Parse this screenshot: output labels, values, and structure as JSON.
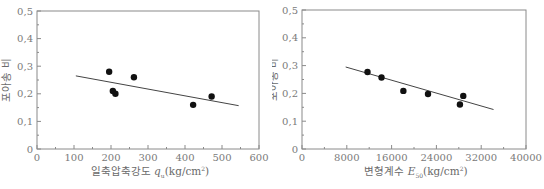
{
  "chart_data": [
    {
      "type": "scatter",
      "title": "",
      "xlabel": "일축압축강도 q_u (kg/cm²)",
      "xlabel_main": "일축압축강도 ",
      "xlabel_var": "q",
      "xlabel_sub": "u",
      "xlabel_unit": "(kg/cm",
      "xlabel_sup": "2",
      "xlabel_close": ")",
      "ylabel": "포아송 비",
      "xlim": [
        0,
        600
      ],
      "ylim": [
        0,
        0.5
      ],
      "xticks": [
        "0",
        "100",
        "200",
        "300",
        "400",
        "500",
        "600"
      ],
      "xtick_values": [
        0,
        100,
        200,
        300,
        400,
        500,
        600
      ],
      "yticks": [
        "0",
        "0.1",
        "0.2",
        "0.3",
        "0.4",
        "0.5"
      ],
      "ytick_values": [
        0,
        0.1,
        0.2,
        0.3,
        0.4,
        0.5
      ],
      "grid": false,
      "legend": null,
      "series": [
        {
          "name": "data",
          "x": [
            195,
            205,
            212,
            262,
            422,
            472
          ],
          "y": [
            0.28,
            0.21,
            0.2,
            0.26,
            0.16,
            0.19
          ]
        }
      ],
      "trendline": {
        "x": [
          105,
          545
        ],
        "y": [
          0.265,
          0.157
        ]
      }
    },
    {
      "type": "scatter",
      "title": "",
      "xlabel": "변형계수 E_50 (kg/cm²)",
      "xlabel_main": "변형계수 ",
      "xlabel_var": "E",
      "xlabel_sub": "50",
      "xlabel_unit": "(kg/cm",
      "xlabel_sup": "2",
      "xlabel_close": ")",
      "ylabel": "포아송 비",
      "xlim": [
        0,
        40000
      ],
      "ylim": [
        0,
        0.5
      ],
      "xticks": [
        "0",
        "8000",
        "16000",
        "24000",
        "32000",
        "40000"
      ],
      "xtick_values": [
        0,
        8000,
        16000,
        24000,
        32000,
        40000
      ],
      "yticks": [
        "0",
        "0.1",
        "0.2",
        "0.3",
        "0.4",
        "0.5"
      ],
      "ytick_values": [
        0,
        0.1,
        0.2,
        0.3,
        0.4,
        0.5
      ],
      "grid": false,
      "legend": null,
      "series": [
        {
          "name": "data",
          "x": [
            11700,
            14200,
            18100,
            22500,
            28200,
            28800
          ],
          "y": [
            0.277,
            0.257,
            0.209,
            0.198,
            0.16,
            0.191
          ]
        }
      ],
      "trendline": {
        "x": [
          7800,
          34200
        ],
        "y": [
          0.295,
          0.142
        ]
      }
    }
  ],
  "colors": {
    "axis": "#8a8a8a",
    "marker": "#111111",
    "line": "#444444",
    "text": "#6a6a6a"
  }
}
